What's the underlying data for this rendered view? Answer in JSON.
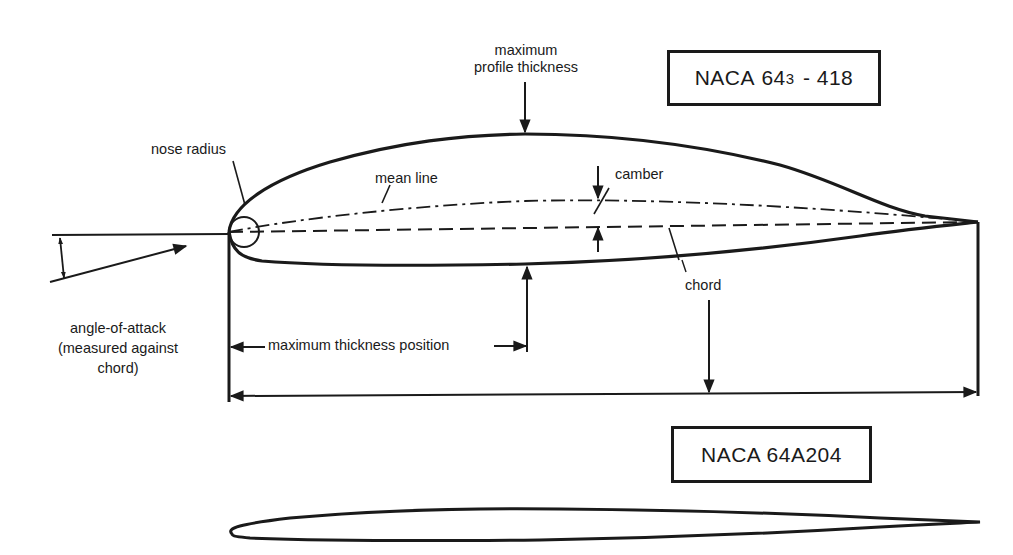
{
  "diagram": {
    "title_boxes": [
      {
        "id": "profile-1",
        "name": "NACA",
        "series": "64",
        "subscript": "3",
        "suffix": "- 418"
      },
      {
        "id": "profile-2",
        "label": "NACA 64A204"
      }
    ],
    "labels": {
      "max_profile_thickness_line1": "maximum",
      "max_profile_thickness_line2": "profile thickness",
      "nose_radius": "nose radius",
      "mean_line": "mean line",
      "camber": "camber",
      "chord": "chord",
      "max_thickness_position": "maximum thickness position",
      "angle_of_attack_line1": "angle-of-attack",
      "angle_of_attack_line2": "(measured against",
      "angle_of_attack_line3": "chord)"
    },
    "colors": {
      "ink": "#1a1a1a",
      "background": "#ffffff"
    }
  }
}
